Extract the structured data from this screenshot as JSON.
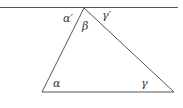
{
  "diagram": {
    "colors": {
      "line": "#555555",
      "text": "#333333",
      "background": "#ffffff"
    },
    "labels": {
      "alpha_prime": "α′",
      "beta": "β",
      "gamma_prime": "γ′",
      "alpha": "α",
      "gamma": "γ"
    }
  }
}
